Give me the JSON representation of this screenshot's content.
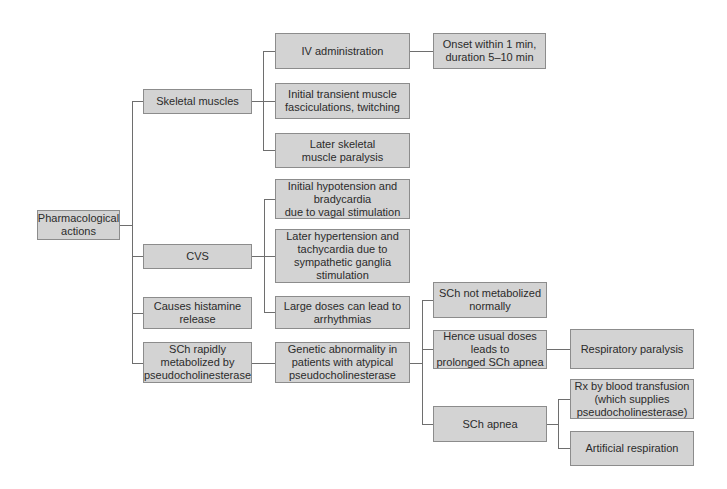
{
  "diagram": {
    "type": "tree",
    "direction": "left-to-right",
    "colors": {
      "box_fill": "#d3d3d3",
      "box_border": "#8c8c8c",
      "line": "#6e6e6e",
      "text": "#2b2b2b"
    },
    "nodes": {
      "root": "Pharmacological\nactions",
      "skeletal": "Skeletal muscles",
      "cvs": "CVS",
      "histamine": "Causes histamine\nrelease",
      "sch_rapid": "SCh rapidly\nmetabolized by\npseudocholinesterase",
      "iv_admin": "IV administration",
      "onset": "Onset within 1 min,\nduration 5–10 min",
      "fasciculations": "Initial transient muscle\nfasciculations, twitching",
      "later_paralysis": "Later skeletal\nmuscle paralysis",
      "hypotension": "Initial hypotension and\nbradycardia\ndue to vagal stimulation",
      "hypertension": "Later hypertension and\ntachycardia due to\nsympathetic ganglia\nstimulation",
      "arrhythmias": "Large doses can lead to\narrhythmias",
      "genetic": "Genetic abnormality in\npatients with  atypical\npseudocholinesterase",
      "not_metabolized": "SCh not metabolized\nnormally",
      "prolonged_apnea": "Hence usual doses\nleads to\nprolonged SCh apnea",
      "sch_apnea": "SCh apnea",
      "resp_paralysis": "Respiratory paralysis",
      "blood_transfusion": "Rx by blood transfusion\n(which supplies\npseudocholinesterase)",
      "artificial_resp": "Artificial respiration"
    },
    "edges": [
      [
        "root",
        "skeletal"
      ],
      [
        "root",
        "cvs"
      ],
      [
        "root",
        "histamine"
      ],
      [
        "root",
        "sch_rapid"
      ],
      [
        "skeletal",
        "iv_admin"
      ],
      [
        "skeletal",
        "fasciculations"
      ],
      [
        "skeletal",
        "later_paralysis"
      ],
      [
        "iv_admin",
        "onset"
      ],
      [
        "cvs",
        "hypotension"
      ],
      [
        "cvs",
        "hypertension"
      ],
      [
        "cvs",
        "arrhythmias"
      ],
      [
        "sch_rapid",
        "genetic"
      ],
      [
        "genetic",
        "not_metabolized"
      ],
      [
        "genetic",
        "prolonged_apnea"
      ],
      [
        "genetic",
        "sch_apnea"
      ],
      [
        "prolonged_apnea",
        "resp_paralysis"
      ],
      [
        "sch_apnea",
        "blood_transfusion"
      ],
      [
        "sch_apnea",
        "artificial_resp"
      ]
    ]
  }
}
